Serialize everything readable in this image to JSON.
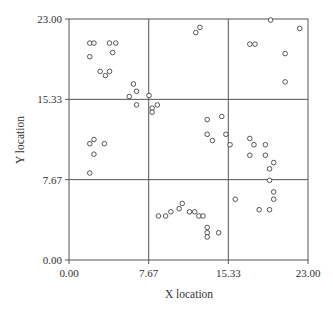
{
  "chart_data": {
    "type": "scatter",
    "title": "",
    "xlabel": "X location",
    "ylabel": "Y location",
    "xlim": [
      0,
      23
    ],
    "ylim": [
      0,
      23
    ],
    "xticks": [
      "0.00",
      "7.67",
      "15.33",
      "23.00"
    ],
    "yticks": [
      "0.00",
      "7.67",
      "15.33",
      "23.00"
    ],
    "grid": "quadrat grid at 7.67 and 15.33 on both axes",
    "marker": "open circle",
    "colors": {
      "frame": "#555555",
      "marker": "#444444",
      "text": "#333333"
    },
    "series": [
      {
        "name": "points",
        "points": [
          [
            2.0,
            20.7
          ],
          [
            2.4,
            20.7
          ],
          [
            3.9,
            20.7
          ],
          [
            4.5,
            20.7
          ],
          [
            4.2,
            19.8
          ],
          [
            2.0,
            19.4
          ],
          [
            3.0,
            18.0
          ],
          [
            3.9,
            18.0
          ],
          [
            3.5,
            17.6
          ],
          [
            6.2,
            16.8
          ],
          [
            6.5,
            16.1
          ],
          [
            5.8,
            15.6
          ],
          [
            7.7,
            15.7
          ],
          [
            6.5,
            14.8
          ],
          [
            8.5,
            14.8
          ],
          [
            8.0,
            14.5
          ],
          [
            8.0,
            14.1
          ],
          [
            2.0,
            11.1
          ],
          [
            2.4,
            11.5
          ],
          [
            3.4,
            11.1
          ],
          [
            2.4,
            10.1
          ],
          [
            2.0,
            8.3
          ],
          [
            12.2,
            21.7
          ],
          [
            12.6,
            22.2
          ],
          [
            19.4,
            22.9
          ],
          [
            22.2,
            22.1
          ],
          [
            17.4,
            20.6
          ],
          [
            17.9,
            20.6
          ],
          [
            20.8,
            19.7
          ],
          [
            20.8,
            17.0
          ],
          [
            13.3,
            13.4
          ],
          [
            14.7,
            13.7
          ],
          [
            13.3,
            12.0
          ],
          [
            13.8,
            11.4
          ],
          [
            15.1,
            12.0
          ],
          [
            15.5,
            11.0
          ],
          [
            17.4,
            11.6
          ],
          [
            17.8,
            11.0
          ],
          [
            18.9,
            11.0
          ],
          [
            17.4,
            10.0
          ],
          [
            18.9,
            10.0
          ],
          [
            19.7,
            9.3
          ],
          [
            19.3,
            8.7
          ],
          [
            19.3,
            7.6
          ],
          [
            19.7,
            6.5
          ],
          [
            19.7,
            5.8
          ],
          [
            16.0,
            5.8
          ],
          [
            18.3,
            4.8
          ],
          [
            19.3,
            4.8
          ],
          [
            8.6,
            4.2
          ],
          [
            9.3,
            4.2
          ],
          [
            9.8,
            4.6
          ],
          [
            10.6,
            4.9
          ],
          [
            10.9,
            5.4
          ],
          [
            11.6,
            4.6
          ],
          [
            12.1,
            4.6
          ],
          [
            12.5,
            4.2
          ],
          [
            12.9,
            4.2
          ],
          [
            13.3,
            3.1
          ],
          [
            13.3,
            2.6
          ],
          [
            13.3,
            2.2
          ],
          [
            14.4,
            2.6
          ]
        ]
      }
    ]
  }
}
